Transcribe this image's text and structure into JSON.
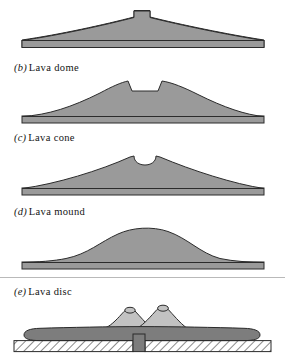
{
  "figure": {
    "kind": "scientific-line-figure",
    "title_visible": false,
    "background_color": "#ffffff",
    "panels": [
      {
        "id": "a",
        "enum_label": "",
        "caption": "",
        "caption_visible": false,
        "form_name": "lava shield",
        "description": "very low, broad shield profile with a small narrow summit notch on a thin flat base slab",
        "fill_color": "#9a9a9a",
        "stroke_color": "#2b2b2b",
        "crater": "narrow rectangular notch"
      },
      {
        "id": "b",
        "enum_label": "(b)",
        "caption": "Lava dome",
        "caption_visible": true,
        "form_name": "lava dome",
        "description": "broad convex dome with a wide flat-floored trapezoidal summit crater on a thin flat base slab",
        "fill_color": "#9a9a9a",
        "stroke_color": "#2b2b2b",
        "crater": "wide flat-floored crater"
      },
      {
        "id": "c",
        "enum_label": "(c)",
        "caption": "Lava cone",
        "caption_visible": true,
        "form_name": "lava cone",
        "description": "steeper central cone with concave flanks and a rounded U-shaped summit crater on a thin flat base slab",
        "fill_color": "#9a9a9a",
        "stroke_color": "#2b2b2b",
        "crater": "rounded U-shaped crater"
      },
      {
        "id": "d",
        "enum_label": "(d)",
        "caption": "Lava mound",
        "caption_visible": true,
        "form_name": "lava mound",
        "description": "smooth symmetric bell-shaped mound with no summit crater on a thin flat base slab",
        "fill_color": "#9a9a9a",
        "stroke_color": "#2b2b2b",
        "crater": "none"
      },
      {
        "id": "e",
        "enum_label": "(e)",
        "caption": "Lava disc",
        "caption_visible": true,
        "form_name": "lava disc",
        "description": "flat lenticular lava disc resting on hatched bedrock, fed by a central vertical conduit, with two light-toned cones bearing small summit craters on top",
        "fill_color": "#7d7d7d",
        "cone_fill_color": "#c2c2c2",
        "stroke_color": "#2b2b2b",
        "bedrock_label": "hatched bedrock",
        "conduit_label": "feeder conduit",
        "crater": "two small summit craters"
      }
    ],
    "separator_color": "#b9b9b9"
  }
}
